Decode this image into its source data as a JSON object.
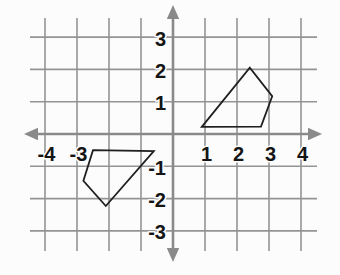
{
  "chart_data": {
    "type": "line",
    "subtype": "coordinate-plane-with-polygons",
    "title": "",
    "xlabel": "",
    "ylabel": "",
    "xlim": [
      -4.7,
      4.7
    ],
    "ylim": [
      -4.0,
      4.0
    ],
    "grid": true,
    "x_gridlines": [
      -4,
      -3,
      -2,
      -1,
      0,
      1,
      2,
      3,
      4
    ],
    "y_gridlines": [
      -3,
      -2,
      -1,
      0,
      1,
      2,
      3
    ],
    "x_tick_labels": [
      {
        "value": -4,
        "label": "-4"
      },
      {
        "value": -3,
        "label": "-3"
      },
      {
        "value": 1,
        "label": "1"
      },
      {
        "value": 2,
        "label": "2"
      },
      {
        "value": 3,
        "label": "3"
      },
      {
        "value": 4,
        "label": "4"
      }
    ],
    "y_tick_labels": [
      {
        "value": 3,
        "label": "3"
      },
      {
        "value": 2,
        "label": "2"
      },
      {
        "value": 1,
        "label": "1"
      },
      {
        "value": -1,
        "label": "-1"
      },
      {
        "value": -2,
        "label": "-2"
      },
      {
        "value": -3,
        "label": "-3"
      }
    ],
    "series": [
      {
        "name": "quadrilateral-quadrant-1",
        "shape": "closed-polygon",
        "points": [
          [
            0.9,
            0.22
          ],
          [
            2.4,
            2.05
          ],
          [
            3.1,
            1.17
          ],
          [
            2.75,
            0.23
          ]
        ]
      },
      {
        "name": "quadrilateral-quadrant-3",
        "shape": "closed-polygon",
        "points": [
          [
            -2.5,
            -0.5
          ],
          [
            -0.6,
            -0.53
          ],
          [
            -2.1,
            -2.23
          ],
          [
            -2.8,
            -1.45
          ]
        ]
      }
    ],
    "legend": null,
    "colors": {
      "background": "#fcfcfc",
      "grid": "#949494",
      "axis": "#8a8a8a",
      "shape_stroke": "#1f1f1f",
      "tick_label": "#151515"
    }
  }
}
